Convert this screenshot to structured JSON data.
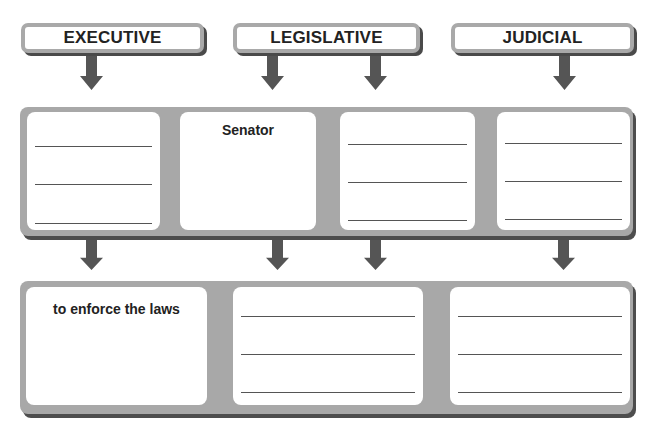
{
  "branches": [
    {
      "label": "EXECUTIVE"
    },
    {
      "label": "LEGISLATIVE"
    },
    {
      "label": "JUDICIAL"
    }
  ],
  "row1": {
    "cells": [
      {
        "text": "",
        "blank_lines": 3
      },
      {
        "text": "Senator",
        "blank_lines": 0
      },
      {
        "text": "",
        "blank_lines": 3
      },
      {
        "text": "",
        "blank_lines": 3
      }
    ]
  },
  "row2": {
    "cells": [
      {
        "text": "to enforce the laws",
        "blank_lines": 0
      },
      {
        "text": "",
        "blank_lines": 3
      },
      {
        "text": "",
        "blank_lines": 3
      }
    ]
  },
  "colors": {
    "panel": "#a8a8a8",
    "shadow": "#4d4d4d",
    "arrow": "#555555",
    "text": "#222222"
  }
}
